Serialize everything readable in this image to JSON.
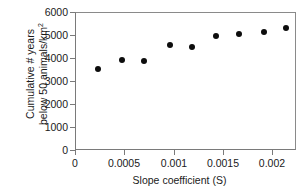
{
  "chart_data": {
    "type": "scatter",
    "title": "",
    "xlabel": "Slope coefficient (S)",
    "ylabel_line1": "Cumulative # years",
    "ylabel_line2": "below 50 animals/km",
    "ylabel_exponent": "2",
    "xlim": [
      0,
      0.00224
    ],
    "ylim": [
      0,
      6000
    ],
    "xticks": [
      0,
      0.0005,
      0.001,
      0.0015,
      0.002
    ],
    "xtick_labels": [
      "0",
      "0.0005",
      "0.001",
      "0.0015",
      "0.002"
    ],
    "yticks": [
      0,
      1000,
      2000,
      3000,
      4000,
      5000,
      6000
    ],
    "ytick_labels": [
      "0",
      "1000",
      "2000",
      "3000",
      "4000",
      "5000",
      "6000"
    ],
    "grid": false,
    "legend": false,
    "marker": "filled-circle",
    "marker_color": "#0d0d0d",
    "axis_color": "#7a7a7a",
    "background": "#ffffff",
    "series": [
      {
        "name": "Cumulative years below 50 animals/km2",
        "x": [
          0.00023,
          0.00047,
          0.0007,
          0.00096,
          0.00119,
          0.00143,
          0.00167,
          0.00192,
          0.00215
        ],
        "y": [
          3520,
          3930,
          3880,
          4595,
          4520,
          4970,
          5055,
          5160,
          5325
        ]
      }
    ]
  }
}
